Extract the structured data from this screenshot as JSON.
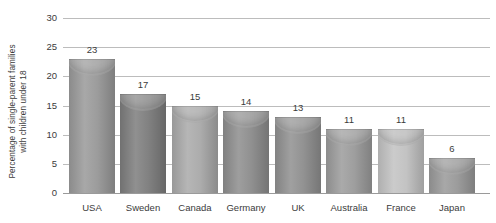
{
  "chart_data": {
    "type": "bar",
    "title": "",
    "subtitle": "",
    "xlabel": "",
    "ylabel_lines": [
      "Percentage of single-parent families",
      "with children under 18"
    ],
    "ylabel": "Percentage of single-parent families with children under 18",
    "categories": [
      "USA",
      "Sweden",
      "Canada",
      "Germany",
      "UK",
      "Australia",
      "France",
      "Japan"
    ],
    "values": [
      23,
      17,
      15,
      14,
      13,
      11,
      11,
      6
    ],
    "value_labels": [
      "23",
      "17",
      "15",
      "14",
      "13",
      "11",
      "11",
      "6"
    ],
    "ylim": [
      0,
      30
    ],
    "ytick_values": [
      0,
      5,
      10,
      15,
      20,
      25,
      30
    ],
    "ytick_labels": [
      "0",
      "5",
      "10",
      "15",
      "20",
      "25",
      "30"
    ],
    "grid": "horizontal",
    "legend": "none",
    "bar_colors": [
      "#9a9a9a",
      "#7e7e7e",
      "#aaaaaa",
      "#8e8e8e",
      "#909090",
      "#9c9c9c",
      "#c2c2c2",
      "#9a9a9a"
    ],
    "gridline_color": "#bcbcbc",
    "axis_color": "#9a9a9a",
    "text_color": "#3b3b3b",
    "background_color": "#ffffff"
  },
  "geometry": {
    "bar_slots": [
      {
        "left": 6,
        "width": 46
      },
      {
        "left": 57,
        "width": 46
      },
      {
        "left": 109,
        "width": 46
      },
      {
        "left": 160,
        "width": 46
      },
      {
        "left": 212,
        "width": 46
      },
      {
        "left": 263,
        "width": 46
      },
      {
        "left": 315,
        "width": 46
      },
      {
        "left": 366,
        "width": 46
      }
    ]
  }
}
